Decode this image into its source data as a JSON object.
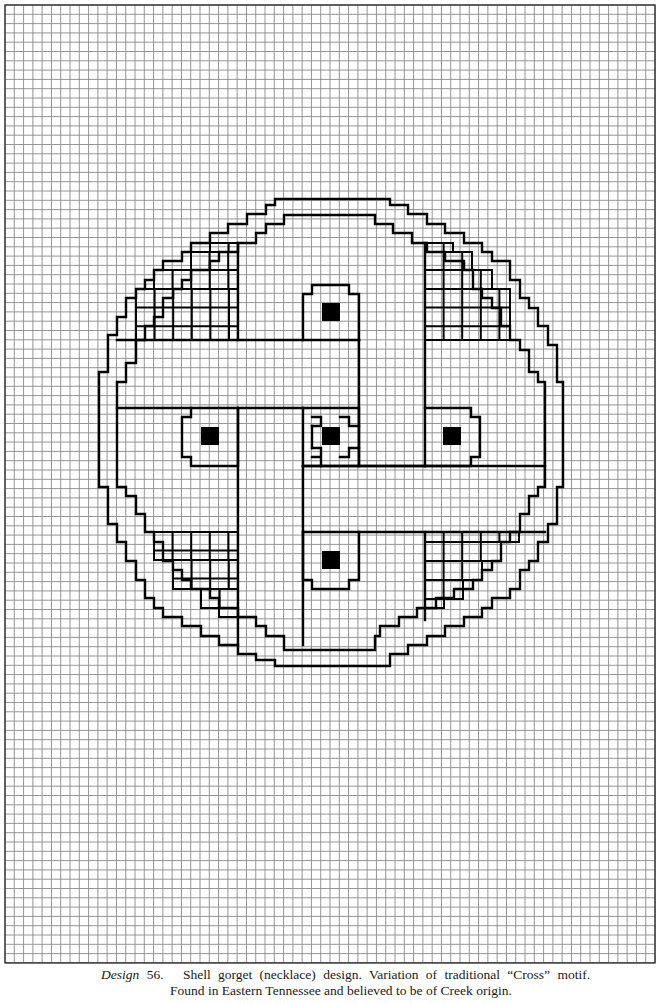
{
  "grid": {
    "origin_x": 5,
    "origin_y": 5,
    "cols": 70,
    "rows": 103,
    "cell_w": 9.286,
    "cell_h": 9.3,
    "line_color": "#8a8a8a",
    "border_color": "#333333"
  },
  "motif": {
    "stroke": "#000000",
    "stroke_width": 2.4,
    "paths": [
      "M275 199 L390 199 L390 205 L408 205 L408 214 L427 214 L427 224 L445 224 L445 233 L464 233 L464 243 L482 243 L482 252 L492 252 L492 261 L510 261 L510 280 L520 280 L520 298 L529 298 L529 308 L538 308 L538 326 L548 326 L548 345 L557 345 L557 382 L563 382 L563 487 L557 487 L557 524 L548 524 L548 542 L538 542 L538 561 L529 561 L529 570 L520 570 L520 589 L510 589 L510 598 L492 598 L492 608 L482 608 L482 617 L464 617 L464 626 L445 626 L445 636 L427 636 L427 645 L408 645 L408 654 L390 654 L390 666 L275 666 L275 660 L256 660 L256 654 L238 654 L238 645 L219 645 L219 636 L201 636 L201 626 L182 626 L182 617 L163 617 L163 608 L154 608 L154 598 L145 598 L145 580 L136 580 L136 561 L126 561 L126 542 L117 542 L117 524 L108 524 L108 487 L99 487 L99 372 L108 372 L108 335 L117 335 L117 317 L126 317 L126 298 L136 298 L136 289 L145 289 L145 280 L154 280 L154 270 L163 270 L163 261 L182 261 L182 252 L191 252 L191 243 L210 243 L210 233 L228 233 L228 224 L247 224 L247 214 L266 214 L266 205 L275 205 Z",
      "M284 215 L375 215 L375 224 L393 224 L393 233 L412 233 L412 243 L427 243 L427 252 L445 252 L445 261 L464 261 L464 270 L473 270 L473 289 L482 289 L482 298 L492 298 L492 308 L501 308 L501 326 L510 326 L510 340 L520 340 L520 350 L529 350 L529 372 L538 372 L538 382 L545 382 L545 487 L538 487 L538 496 L529 496 L529 514 L520 514 L520 532 L510 532 L510 542 L501 542 L501 561 L492 561 L492 570 L482 570 L482 580 L473 580 L473 589 L454 589 L454 598 L436 598 L436 608 L417 608 L417 617 L399 617 L399 626 L380 626 L380 636 L375 636 L375 650 L284 650 L284 636 L266 636 L266 626 L256 626 L256 617 L238 617 L238 608 L219 608 L219 598 L210 598 L210 589 L191 589 L191 580 L182 580 L182 570 L173 570 L173 561 L163 561 L163 542 L154 542 L154 532 L145 532 L145 514 L136 514 L136 496 L126 496 L126 487 L117 487 L117 382 L126 382 L126 363 L136 363 L136 340 L145 340 L145 326 L154 326 L154 317 L163 317 L163 298 L173 298 L173 289 L182 289 L182 280 L191 280 L191 270 L210 270 L210 261 L219 261 L219 252 L238 252 L238 243 L256 243 L256 233 L266 233 L266 224 L284 224 Z",
      "M117 340 L359 340",
      "M117 408 L303 408",
      "M359 340 L359 466",
      "M425 243 L425 466",
      "M238 243 L238 340",
      "M238 408 L238 645",
      "M303 466 L545 466",
      "M303 532 L545 532",
      "M303 466 L303 645",
      "M359 466 L425 466",
      "M425 532 L425 620",
      "M303 340 L303 294 L312 294 L312 285 L349 285 L349 294 L359 294 L359 340",
      "M238 408 L238 466 L191 466 L191 457 L182 457 L182 417 L191 417 L191 408",
      "M425 408 L471 408 L471 417 L480 417 L480 457 L471 457 L471 466 L425 466",
      "M303 532 L303 580 L312 580 L312 589 L349 589 L349 580 L359 580 L359 532",
      "M303 408 L303 466 L359 466 L359 408 Z",
      "M312 417 L321 417 L321 426 L312 426",
      "M340 417 L349 417 L349 426 L359 426",
      "M312 448 L321 448 L321 457 L312 457 M321 457 L321 466",
      "M340 457 L349 457 L349 448 L359 448",
      "M312 426 L312 448"
    ],
    "hatch_cells": [
      {
        "x": 136,
        "y": 289,
        "w": 102,
        "h": 51
      },
      {
        "x": 154,
        "y": 270,
        "w": 84,
        "h": 19
      },
      {
        "x": 191,
        "y": 252,
        "w": 47,
        "h": 18
      },
      {
        "x": 210,
        "y": 243,
        "w": 28,
        "h": 9
      },
      {
        "x": 425,
        "y": 243,
        "w": 28,
        "h": 9
      },
      {
        "x": 425,
        "y": 252,
        "w": 47,
        "h": 18
      },
      {
        "x": 425,
        "y": 270,
        "w": 67,
        "h": 19
      },
      {
        "x": 425,
        "y": 289,
        "w": 85,
        "h": 51
      },
      {
        "x": 154,
        "y": 532,
        "w": 84,
        "h": 28
      },
      {
        "x": 173,
        "y": 560,
        "w": 65,
        "h": 29
      },
      {
        "x": 201,
        "y": 589,
        "w": 37,
        "h": 19
      },
      {
        "x": 219,
        "y": 608,
        "w": 19,
        "h": 9
      },
      {
        "x": 425,
        "y": 532,
        "w": 94,
        "h": 10
      },
      {
        "x": 425,
        "y": 542,
        "w": 76,
        "h": 19
      },
      {
        "x": 425,
        "y": 561,
        "w": 57,
        "h": 19
      },
      {
        "x": 425,
        "y": 580,
        "w": 38,
        "h": 19
      },
      {
        "x": 425,
        "y": 599,
        "w": 19,
        "h": 9
      }
    ],
    "hatch_step": 18.6,
    "filled_squares": [
      {
        "name": "top",
        "x": 322,
        "y": 303,
        "w": 18,
        "h": 18
      },
      {
        "name": "left",
        "x": 201,
        "y": 427,
        "w": 18,
        "h": 18
      },
      {
        "name": "center",
        "x": 322,
        "y": 427,
        "w": 18,
        "h": 18
      },
      {
        "name": "right",
        "x": 443,
        "y": 427,
        "w": 18,
        "h": 18
      },
      {
        "name": "bottom",
        "x": 322,
        "y": 551,
        "w": 18,
        "h": 18
      }
    ]
  },
  "caption": {
    "label": "Design",
    "number": "56.",
    "line1": "Shell gorget (necklace) design. Variation of traditional “Cross” motif.",
    "line2": "Found in Eastern Tennessee and believed to be of Creek origin."
  }
}
